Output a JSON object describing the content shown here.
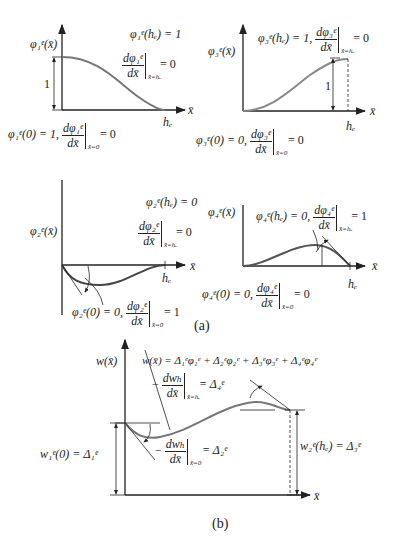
{
  "figure": {
    "caption_a": "(a)",
    "caption_b": "(b)",
    "axis_label": "x̄",
    "element_length": "hₑ"
  },
  "panels": [
    {
      "id": "phi1",
      "y_label": "φ₁ᵉ(x̄)",
      "height_label": "1",
      "bc_end_value": "φ₁ᵉ(hₑ) = 1",
      "bc_end_slope_num": "dφ₁ᵉ",
      "bc_end_slope_den": "dx̄",
      "bc_end_slope_at": "x̄=hₑ",
      "bc_end_slope_val": "= 0",
      "bc_start_value": "φ₁ᵉ(0) = 1,",
      "bc_start_slope_num": "dφ₁ᵉ",
      "bc_start_slope_den": "dx̄",
      "bc_start_slope_at": "x̄=0",
      "bc_start_slope_val": "= 0"
    },
    {
      "id": "phi3",
      "y_label": "φ₃ᵉ(x̄)",
      "height_label": "1",
      "bc_end_value": "φ₃ᵉ(hₑ) = 1,",
      "bc_end_slope_num": "dφ₃ᵉ",
      "bc_end_slope_den": "dx̄",
      "bc_end_slope_at": "x̄=hₑ",
      "bc_end_slope_val": "= 0",
      "bc_start_value": "φ₃ᵉ(0) = 0,",
      "bc_start_slope_num": "dφ₃ᵉ",
      "bc_start_slope_den": "dx̄",
      "bc_start_slope_at": "x̄=0",
      "bc_start_slope_val": "= 0"
    },
    {
      "id": "phi2",
      "y_label": "φ₂ᵉ(x̄)",
      "bc_end_value": "φ₂ᵉ(hₑ) = 0",
      "bc_end_slope_num": "dφ₂ᵉ",
      "bc_end_slope_den": "dx̄",
      "bc_end_slope_at": "x̄=hₑ",
      "bc_end_slope_val": "= 0",
      "bc_start_value": "φ₂ᵉ(0) = 0,",
      "bc_start_slope_num": "dφ₂ᵉ",
      "bc_start_slope_den": "dx̄",
      "bc_start_slope_at": "x̄=0",
      "bc_start_slope_val": "= 1"
    },
    {
      "id": "phi4",
      "y_label": "φ₄ᵉ(x̄)",
      "bc_end_value": "φ₄ᵉ(hₑ) = 0,",
      "bc_end_slope_num": "dφ₄ᵉ",
      "bc_end_slope_den": "dx̄",
      "bc_end_slope_at": "x̄=hₑ",
      "bc_end_slope_val": "= 1",
      "bc_start_value": "φ₄ᵉ(0) = 0,",
      "bc_start_slope_num": "dφ₄ᵉ",
      "bc_start_slope_den": "dx̄",
      "bc_start_slope_at": "x̄=0",
      "bc_start_slope_val": "= 0"
    }
  ],
  "panel_b": {
    "y_label": "w(x̄)",
    "interpolation": "w(x̄) = Δ₁ᵉφ₁ᵉ + Δ₂ᵉφ₂ᵉ + Δ₃ᵉφ₃ᵉ + Δ₄ᵉφ₄ᵉ",
    "end_slope_num": "dwₕ",
    "end_slope_den": "dx̄",
    "end_slope_at": "x̄=hₑ",
    "end_slope_val": "= Δ₄ᵉ",
    "start_slope_num": "dwₕ",
    "start_slope_den": "dx̄",
    "start_slope_at": "x̄=0",
    "start_slope_val": "= Δ₂ᵉ",
    "minus": "−",
    "start_value": "w₁ᵉ(0) = Δ₁ᵉ",
    "end_value": "w₂ᵉ(hₑ) = Δ₃ᵉ"
  }
}
